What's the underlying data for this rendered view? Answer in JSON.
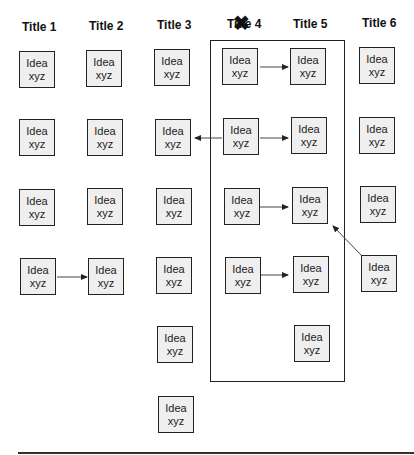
{
  "titles": [
    "Title 1",
    "Title 2",
    "Title 3",
    "Title 4",
    "Title 5",
    "Title 6"
  ],
  "title4_struck": true,
  "box_label_line1": "Idea",
  "box_label_line2": "xyz",
  "columns": [
    {
      "title": "Title 1",
      "boxes": 4
    },
    {
      "title": "Title 2",
      "boxes": 4
    },
    {
      "title": "Title 3",
      "boxes": 6
    },
    {
      "title": "Title 4",
      "boxes": 4
    },
    {
      "title": "Title 5",
      "boxes": 5
    },
    {
      "title": "Title 6",
      "boxes": 4
    }
  ],
  "arrows": [
    {
      "from": "Title 4 row 1",
      "to": "Title 5 row 1"
    },
    {
      "from": "Title 4 row 2",
      "to": "Title 3 row 2"
    },
    {
      "from": "Title 4 row 2",
      "to": "Title 5 row 2"
    },
    {
      "from": "Title 4 row 3",
      "to": "Title 5 row 3"
    },
    {
      "from": "Title 6 row 4",
      "to": "Title 5 row 3"
    },
    {
      "from": "Title 1 row 4",
      "to": "Title 2 row 4"
    },
    {
      "from": "Title 4 row 4",
      "to": "Title 5 row 4"
    }
  ],
  "colors": {
    "box_fill": "#efefef",
    "stroke": "#222222"
  }
}
